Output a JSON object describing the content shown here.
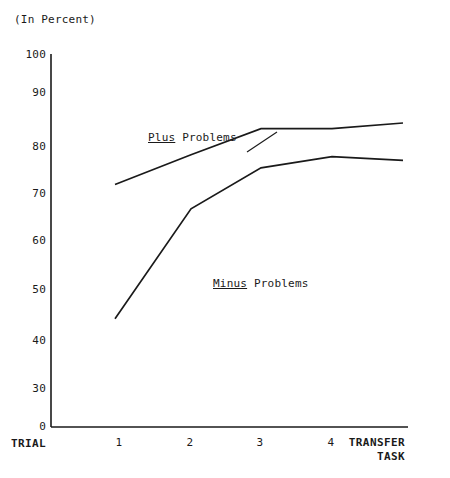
{
  "chart_data": {
    "type": "line",
    "title": "",
    "subtitle": "",
    "unit_caption": "(In Percent)",
    "xlabel": "TRIAL",
    "ylabel": "",
    "categories": [
      "1",
      "2",
      "3",
      "4",
      "TRANSFER TASK"
    ],
    "x_tick_labels": [
      "1",
      "2",
      "3",
      "4"
    ],
    "x_end_label_line1": "TRANSFER",
    "x_end_label_line2": "TASK",
    "y_tick_labels": [
      "100",
      "90",
      "80",
      "70",
      "60",
      "50",
      "40",
      "30",
      "0"
    ],
    "y_tick_values": [
      100,
      90,
      80,
      70,
      60,
      50,
      40,
      30,
      0
    ],
    "ylim": [
      0,
      100
    ],
    "grid": false,
    "legend_position": "inline-annotations",
    "series": [
      {
        "name": "Plus Problems",
        "label_underlined_word": "Plus",
        "label_plain_word": "Problems",
        "values": [
          65,
          73,
          80,
          80,
          81.5
        ],
        "color": "#1a1a1a"
      },
      {
        "name": "Minus Problems",
        "label_underlined_word": "Minus",
        "label_plain_word": "Problems",
        "values": [
          29,
          58.5,
          69.5,
          72.5,
          71.5
        ],
        "color": "#1a1a1a"
      }
    ],
    "annotations": [
      {
        "text": "Plus Problems",
        "series": "Plus Problems"
      },
      {
        "text": "Minus Problems",
        "series": "Minus Problems"
      }
    ]
  },
  "axis": {
    "line_color": "#1a1a1a",
    "background": "#ffffff"
  },
  "yticks": [
    {
      "label": "100"
    },
    {
      "label": "90"
    },
    {
      "label": "80"
    },
    {
      "label": "70"
    },
    {
      "label": "60"
    },
    {
      "label": "50"
    },
    {
      "label": "40"
    },
    {
      "label": "30"
    },
    {
      "label": "0"
    }
  ],
  "xticks": [
    {
      "label": "1"
    },
    {
      "label": "2"
    },
    {
      "label": "3"
    },
    {
      "label": "4"
    }
  ]
}
